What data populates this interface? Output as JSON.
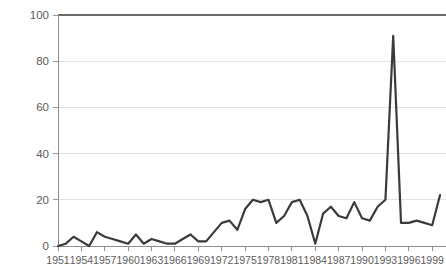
{
  "chart_data": {
    "type": "line",
    "title": "",
    "subtitle": "",
    "xlabel": "",
    "ylabel": "",
    "xlim": [
      1951,
      2000
    ],
    "ylim": [
      0,
      100
    ],
    "grid": true,
    "legend": false,
    "legend_position": "none",
    "line_color": "#3b3b3b",
    "gridline_color": "#e2e2e2",
    "axis_color": "#8e8e8e",
    "tick_label_color": "#5d5d5d",
    "background_color": "#ffffff",
    "y_ticks": [
      0,
      20,
      40,
      60,
      80,
      100
    ],
    "y_tick_labels": [
      "0",
      "20",
      "40",
      "60",
      "80",
      "100"
    ],
    "x_ticks": [
      1951,
      1954,
      1957,
      1960,
      1963,
      1966,
      1969,
      1972,
      1975,
      1978,
      1981,
      1984,
      1987,
      1990,
      1993,
      1996,
      1999
    ],
    "x_tick_labels": [
      "1951",
      "1954",
      "1957",
      "1960",
      "1963",
      "1966",
      "1969",
      "1972",
      "1975",
      "1978",
      "1981",
      "1984",
      "1987",
      "1990",
      "1993",
      "1996",
      "1999"
    ],
    "x": [
      1951,
      1952,
      1953,
      1954,
      1955,
      1956,
      1957,
      1958,
      1959,
      1960,
      1961,
      1962,
      1963,
      1964,
      1965,
      1966,
      1967,
      1968,
      1969,
      1970,
      1971,
      1972,
      1973,
      1974,
      1975,
      1976,
      1977,
      1978,
      1979,
      1980,
      1981,
      1982,
      1983,
      1984,
      1985,
      1986,
      1987,
      1988,
      1989,
      1990,
      1991,
      1992,
      1993,
      1994,
      1995,
      1996,
      1997,
      1998,
      1999,
      2000
    ],
    "values": [
      0,
      1,
      4,
      2,
      0,
      6,
      4,
      3,
      2,
      1,
      5,
      1,
      3,
      2,
      1,
      1,
      3,
      5,
      2,
      2,
      6,
      10,
      11,
      7,
      16,
      20,
      19,
      20,
      10,
      13,
      19,
      20,
      13,
      1,
      14,
      17,
      13,
      12,
      19,
      12,
      11,
      17,
      20,
      91,
      10,
      10,
      11,
      10,
      9,
      22
    ],
    "series": [
      {
        "name": "value",
        "values": [
          0,
          1,
          4,
          2,
          0,
          6,
          4,
          3,
          2,
          1,
          5,
          1,
          3,
          2,
          1,
          1,
          3,
          5,
          2,
          2,
          6,
          10,
          11,
          7,
          16,
          20,
          19,
          20,
          10,
          13,
          19,
          20,
          13,
          1,
          14,
          17,
          13,
          12,
          19,
          12,
          11,
          17,
          20,
          91,
          10,
          10,
          11,
          10,
          9,
          22
        ]
      }
    ],
    "annotations": [],
    "peak": {
      "value": 91,
      "label": ""
    }
  }
}
